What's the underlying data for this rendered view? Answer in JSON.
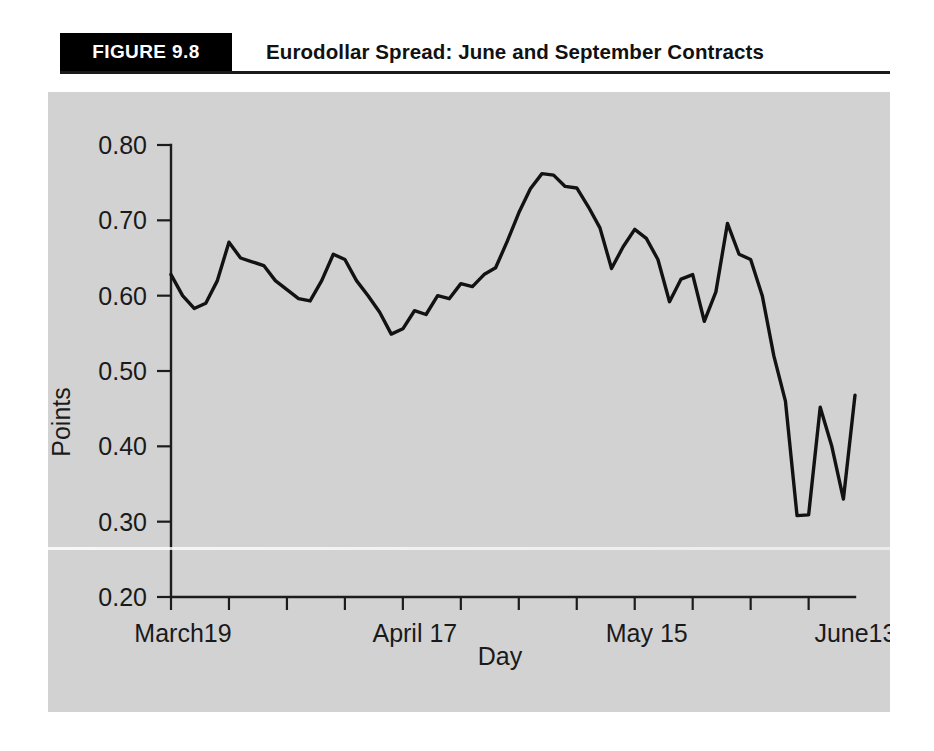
{
  "figure": {
    "badge_label": "FIGURE 9.8",
    "title": "Eurodollar Spread: June and September Contracts"
  },
  "chart_data": {
    "type": "line",
    "title": "Eurodollar Spread: June and September Contracts",
    "xlabel": "Day",
    "ylabel": "Points",
    "ylim": [
      0.2,
      0.8
    ],
    "ytick_labels": [
      "0.80",
      "0.70",
      "0.60",
      "0.50",
      "0.40",
      "0.30",
      "0.20"
    ],
    "yticks": [
      0.8,
      0.7,
      0.6,
      0.5,
      0.4,
      0.3,
      0.2
    ],
    "xtick_labels": [
      "March19",
      "April 17",
      "May 15",
      "June13"
    ],
    "xtick_positions": [
      0,
      20,
      40,
      58
    ],
    "grid": false,
    "legend": null,
    "series": [
      {
        "name": "Eurodollar June-September spread",
        "x": [
          0,
          1,
          2,
          3,
          4,
          5,
          6,
          7,
          8,
          9,
          10,
          11,
          12,
          13,
          14,
          15,
          16,
          17,
          18,
          19,
          20,
          21,
          22,
          23,
          24,
          25,
          26,
          27,
          28,
          29,
          30,
          31,
          32,
          33,
          34,
          35,
          36,
          37,
          38,
          39,
          40,
          41,
          42,
          43,
          44,
          45,
          46,
          47,
          48,
          49,
          50,
          51,
          52,
          53,
          54,
          55,
          56,
          57,
          58,
          59
        ],
        "values": [
          0.628,
          0.6,
          0.583,
          0.59,
          0.62,
          0.671,
          0.65,
          0.645,
          0.64,
          0.62,
          0.608,
          0.596,
          0.593,
          0.62,
          0.655,
          0.648,
          0.62,
          0.6,
          0.578,
          0.549,
          0.556,
          0.58,
          0.575,
          0.6,
          0.596,
          0.616,
          0.612,
          0.628,
          0.637,
          0.672,
          0.71,
          0.742,
          0.762,
          0.76,
          0.745,
          0.743,
          0.718,
          0.69,
          0.636,
          0.665,
          0.688,
          0.676,
          0.648,
          0.592,
          0.622,
          0.628,
          0.566,
          0.605,
          0.696,
          0.655,
          0.648,
          0.6,
          0.52,
          0.46,
          0.308,
          0.309,
          0.452,
          0.4,
          0.33,
          0.468
        ]
      }
    ],
    "annotations": []
  }
}
